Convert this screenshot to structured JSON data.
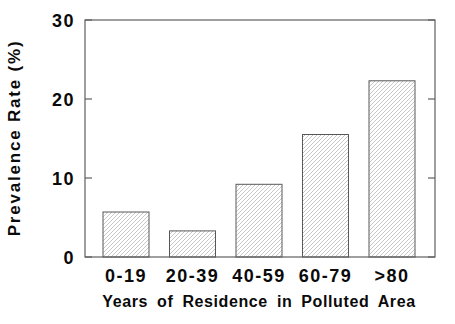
{
  "chart_data": {
    "type": "bar",
    "title": "",
    "xlabel": "Years of Residence in Polluted Area",
    "ylabel": "Prevalence Rate (%)",
    "categories": [
      "0-19",
      "20-39",
      "40-59",
      "60-79",
      ">80"
    ],
    "values": [
      5.7,
      3.3,
      9.2,
      15.5,
      22.3
    ],
    "ylim": [
      0,
      30
    ],
    "yticks": [
      0,
      10,
      20,
      30
    ],
    "grid": false,
    "legend_position": "none",
    "bar_style": "diagonal-hatch",
    "colors": {
      "background": "#ffffff",
      "axis": "#5f5f5f",
      "bar_outline": "#585858",
      "bar_hatch": "#c8c8c8",
      "text": "#0a0a0a"
    }
  }
}
